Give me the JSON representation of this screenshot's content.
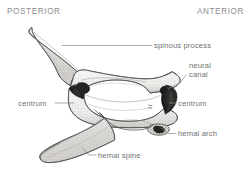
{
  "figure": {
    "style": "stippled pen-and-ink anatomical line drawing",
    "background_color": "#ffffff",
    "ink_color": "#4a4a4a",
    "label_color": "#6f6f6f",
    "orientation_color": "#8d8d8d"
  },
  "orientation": {
    "posterior": "POSTERIOR",
    "anterior": "ANTERIOR"
  },
  "labels": {
    "spinous_process": "spinous process",
    "neural_canal": "neural\ncanal",
    "centrum_left": "centrum",
    "centrum_right": "centrum",
    "hemal_arch": "hemal arch",
    "hemal_spine": "hemal spine"
  }
}
